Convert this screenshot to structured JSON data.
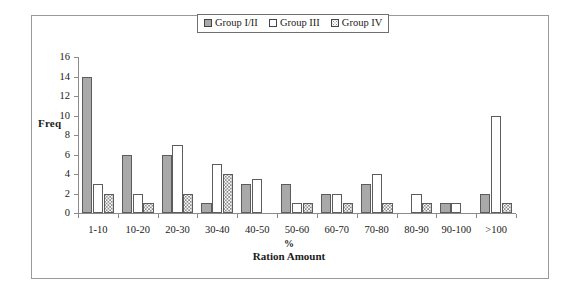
{
  "figure": {
    "legend_position": "top-center",
    "frame_border_color": "#9a9a9a"
  },
  "legend": {
    "items": [
      {
        "label": "Group I/II",
        "swatch": "solid-gray-swatch",
        "color": "#a8a8a8"
      },
      {
        "label": "Group III",
        "swatch": "white-swatch",
        "color": "#ffffff"
      },
      {
        "label": "Group IV",
        "swatch": "dotted-swatch",
        "color": "#8d8d8d"
      }
    ]
  },
  "chart_data": {
    "type": "bar",
    "title": "",
    "subtitle": "",
    "xlabel_line1": "%",
    "xlabel_line2": "Ration Amount",
    "ylabel": "Freq",
    "ylim": [
      0,
      16
    ],
    "ytick_labels": [
      "0",
      "2",
      "4",
      "6",
      "8",
      "10",
      "12",
      "14",
      "16"
    ],
    "yticks": [
      0,
      2,
      4,
      6,
      8,
      10,
      12,
      14,
      16
    ],
    "grid": false,
    "legend_position": "top-center",
    "categories": [
      "1-10",
      "10-20",
      "20-30",
      "30-40",
      "40-50",
      "50-60",
      "60-70",
      "70-80",
      "80-90",
      "90-100",
      ">100"
    ],
    "series": [
      {
        "name": "Group I/II",
        "values": [
          14,
          6,
          6,
          1,
          3,
          3,
          2,
          3,
          0,
          1,
          2
        ]
      },
      {
        "name": "Group III",
        "values": [
          3,
          2,
          7,
          5,
          3.5,
          1,
          2,
          4,
          2,
          1,
          10
        ]
      },
      {
        "name": "Group IV",
        "values": [
          2,
          1,
          2,
          4,
          0,
          1,
          1,
          1,
          1,
          0,
          1
        ]
      }
    ]
  }
}
